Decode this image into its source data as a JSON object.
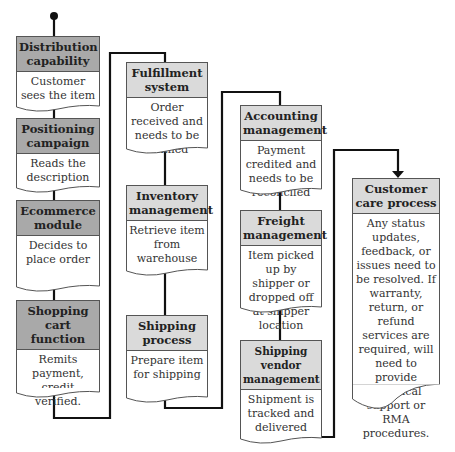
{
  "diagram": {
    "type": "flowchart",
    "columns": [
      {
        "id": "col1",
        "nodes": [
          {
            "header": "Distribution capability",
            "body": "Customer sees the item"
          },
          {
            "header": "Positioning campaign",
            "body": "Reads the description"
          },
          {
            "header": "Ecommerce module",
            "body": "Decides to place order"
          },
          {
            "header": "Shopping cart function",
            "body": "Remits payment, credit verified."
          }
        ]
      },
      {
        "id": "col2",
        "nodes": [
          {
            "header": "Fulfillment system",
            "body": "Order received and needs to be fulfilled"
          },
          {
            "header": "Inventory management",
            "body": "Retrieve item from warehouse"
          },
          {
            "header": "Shipping process",
            "body": "Prepare item for shipping"
          }
        ]
      },
      {
        "id": "col3",
        "nodes": [
          {
            "header": "Accounting management",
            "body": "Payment credited and needs to be reconciled"
          },
          {
            "header": "Freight management",
            "body": "Item picked up by shipper or dropped off at shipper location"
          },
          {
            "header": "Shipping vendor management",
            "body": "Shipment is tracked and delivered"
          }
        ]
      },
      {
        "id": "col4",
        "nodes": [
          {
            "header": "Customer care process",
            "body": "Any status updates, feedback, or issues need to be resolved. If warranty, return, or refund services are required, will need to provide technical support or RMA procedures."
          }
        ]
      }
    ],
    "colors": {
      "header_dark": "#a9a9a9",
      "header_light": "#dadada",
      "line": "#111111"
    }
  }
}
